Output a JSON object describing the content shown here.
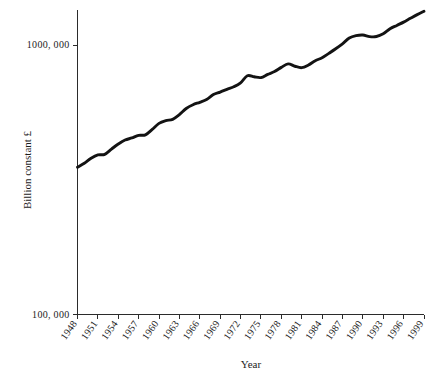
{
  "chart_data": {
    "type": "line",
    "title": "",
    "xlabel": "Year",
    "ylabel": "Billion constant £",
    "yscale": "log",
    "ylim": [
      100000,
      1450000
    ],
    "xlim": [
      1948,
      1999
    ],
    "grid": false,
    "legend": null,
    "y_tick_labels": [
      "1000, 000",
      "100, 000"
    ],
    "y_tick_values": [
      1000000,
      100000
    ],
    "x_tick_labels": [
      "1948",
      "1951",
      "1954",
      "1957",
      "1960",
      "1963",
      "1966",
      "1969",
      "1972",
      "1975",
      "1978",
      "1981",
      "1984",
      "1987",
      "1990",
      "1993",
      "1996",
      "1999"
    ],
    "x_tick_values": [
      1948,
      1951,
      1954,
      1957,
      1960,
      1963,
      1966,
      1969,
      1972,
      1975,
      1978,
      1981,
      1984,
      1987,
      1990,
      1993,
      1996,
      1999
    ],
    "series": [
      {
        "name": "Billion constant £",
        "x": [
          1948,
          1949,
          1950,
          1951,
          1952,
          1953,
          1954,
          1955,
          1956,
          1957,
          1958,
          1959,
          1960,
          1961,
          1962,
          1963,
          1964,
          1965,
          1966,
          1967,
          1968,
          1969,
          1970,
          1971,
          1972,
          1973,
          1974,
          1975,
          1976,
          1977,
          1978,
          1979,
          1980,
          1981,
          1982,
          1983,
          1984,
          1985,
          1986,
          1987,
          1988,
          1989,
          1990,
          1991,
          1992,
          1993,
          1994,
          1995,
          1996,
          1997,
          1998,
          1999
        ],
        "values": [
          352000,
          364000,
          380000,
          391000,
          393000,
          411000,
          429000,
          444000,
          452000,
          462000,
          464000,
          486000,
          512000,
          524000,
          530000,
          552000,
          581000,
          600000,
          613000,
          628000,
          655000,
          669000,
          685000,
          700000,
          724000,
          769000,
          762000,
          757000,
          778000,
          797000,
          826000,
          851000,
          834000,
          824000,
          843000,
          874000,
          897000,
          931000,
          968000,
          1010000,
          1061000,
          1083000,
          1089000,
          1074000,
          1075000,
          1100000,
          1148000,
          1182000,
          1216000,
          1256000,
          1296000,
          1334000
        ]
      }
    ]
  },
  "axis": {
    "x_title": "Year",
    "y_title": "Billion constant £"
  }
}
